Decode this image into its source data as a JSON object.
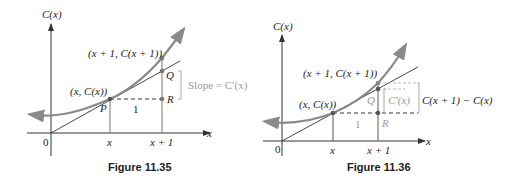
{
  "colors": {
    "curve": "#8a8a8a",
    "axis": "#333333",
    "tangent": "#333333",
    "annotation_gray": "#9a9a9a",
    "text": "#222222"
  },
  "figures": [
    {
      "caption": "Figure 11.35",
      "y_axis_label": "C(x)",
      "x_axis_label": "x",
      "origin_label": "0",
      "x_tick_labels": [
        "x",
        "x + 1"
      ],
      "point_labels": {
        "left_point": "(x, C(x))",
        "right_point": "(x + 1, C(x + 1))",
        "P": "P",
        "Q": "Q",
        "R": "R",
        "run": "1"
      },
      "annotation": "Slope = C′(x)"
    },
    {
      "caption": "Figure 11.36",
      "y_axis_label": "C(x)",
      "x_axis_label": "x",
      "origin_label": "0",
      "x_tick_labels": [
        "x",
        "x + 1"
      ],
      "point_labels": {
        "left_point": "(x, C(x))",
        "right_point": "(x + 1, C(x + 1))",
        "Q": "Q",
        "R": "R",
        "run": "1"
      },
      "inner_annotation": "C′(x)",
      "outer_annotation": "C(x + 1) − C(x)"
    }
  ]
}
